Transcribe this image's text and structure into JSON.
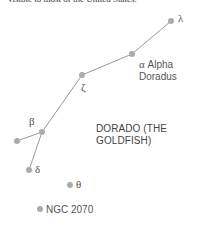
{
  "header_fragment": "visible to most of the United States.",
  "constellation": {
    "title_line1": "DORADO (THE",
    "title_line2": "GOLDFISH)"
  },
  "stars": [
    {
      "id": "lambda",
      "label": "λ",
      "x": 171,
      "y": 21
    },
    {
      "id": "alpha",
      "label_symbol": "α",
      "label_line1": "Alpha",
      "label_line2": "Doradus",
      "x": 132,
      "y": 54
    },
    {
      "id": "zeta",
      "label": "ζ",
      "x": 82,
      "y": 75
    },
    {
      "id": "beta",
      "label": "β",
      "x": 42,
      "y": 132
    },
    {
      "id": "unnamed",
      "label": "",
      "x": 17,
      "y": 141
    },
    {
      "id": "delta",
      "label": "δ",
      "x": 29,
      "y": 170
    },
    {
      "id": "theta",
      "label": "θ",
      "x": 70,
      "y": 185
    },
    {
      "id": "ngc2070",
      "label": "NGC 2070",
      "x": 40,
      "y": 209
    }
  ],
  "colors": {
    "star": "#aaaaaa",
    "line": "#999999",
    "label": "#555555"
  }
}
